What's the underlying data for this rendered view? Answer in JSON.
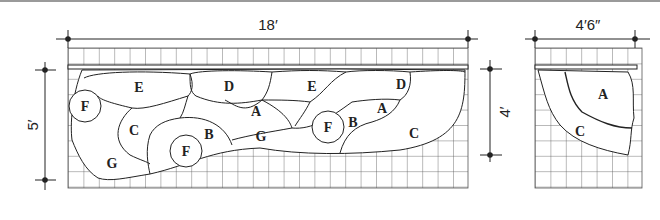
{
  "diagram": {
    "left_plan": {
      "width_dimension": "18′",
      "height_dimension_outer": "5′",
      "height_dimension_inner": "4′",
      "stone_labels": [
        "E",
        "D",
        "E",
        "D",
        "F",
        "C",
        "A",
        "A",
        "B",
        "G",
        "F",
        "F",
        "B",
        "C",
        "G"
      ]
    },
    "right_plan": {
      "width_dimension": "4′6″",
      "stone_labels": [
        "A",
        "C"
      ]
    },
    "colors": {
      "line": "#222222",
      "grid": "#555555",
      "background": "#ffffff"
    }
  }
}
